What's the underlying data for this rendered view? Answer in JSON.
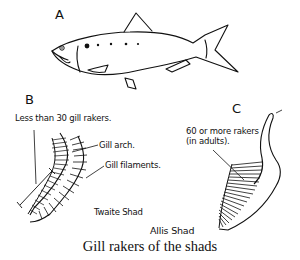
{
  "figure": {
    "caption": "Gill rakers of the shads",
    "panels": {
      "a": {
        "letter": "A",
        "subject": "shad-fish-outline"
      },
      "b": {
        "letter": "B",
        "labels": {
          "rakers": "Less than 30 gill rakers.",
          "arch": "Gill arch.",
          "filaments": "Gill filaments.",
          "species": "Twaite Shad"
        }
      },
      "c": {
        "letter": "C",
        "labels": {
          "rakers_line1": "60 or more rakers",
          "rakers_line2": "(in adults).",
          "species": "Allis Shad"
        }
      }
    },
    "colors": {
      "ink": "#111111",
      "paper": "#ffffff"
    }
  }
}
